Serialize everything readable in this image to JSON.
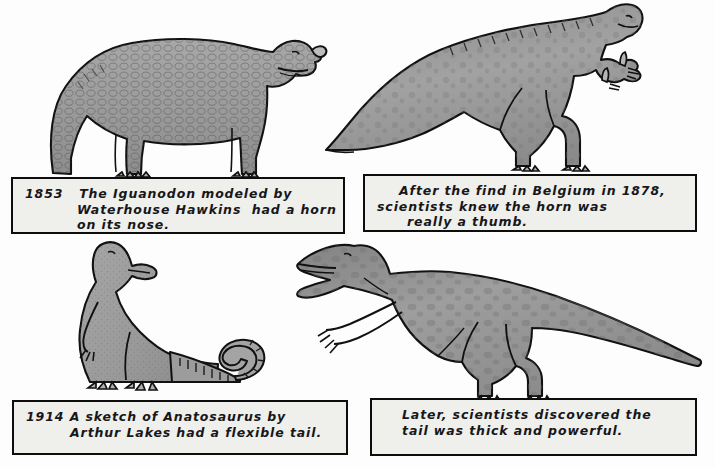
{
  "page": {
    "background_color": "#fdfdfd",
    "ink_color": "#0d0d0d",
    "paper_color": "#efefec",
    "body_fill_color": "#9a9a9a"
  },
  "panels": [
    {
      "id": "top-left",
      "figure_name": "iguanodon-quadruped-with-nose-horn",
      "caption": {
        "lines": [
          "1853   The Iguanodon modeled by",
          "Waterhouse Hawkins  had a horn",
          "on its nose."
        ],
        "year": "1853"
      }
    },
    {
      "id": "top-right",
      "figure_name": "iguanodon-biped-with-thumb-spike",
      "caption": {
        "lines": [
          "After the find in Belgium in 1878,",
          "scientists knew the horn was",
          "really a thumb."
        ],
        "year": "1878"
      }
    },
    {
      "id": "bottom-left",
      "figure_name": "anatosaurus-upright-with-flexible-tail",
      "caption": {
        "lines": [
          "1914 A sketch of Anatosaurus by",
          "Arthur Lakes had a flexible tail."
        ],
        "year": "1914"
      }
    },
    {
      "id": "bottom-right",
      "figure_name": "anatosaurus-horizontal-with-thick-tail",
      "caption": {
        "lines": [
          "Later, scientists discovered the",
          "tail was thick and powerful."
        ],
        "year": ""
      }
    }
  ]
}
